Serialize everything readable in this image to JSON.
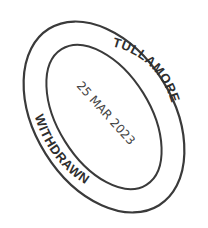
{
  "stamp": {
    "top_text": "TULLAMORE",
    "bottom_text": "WITHDRAWN",
    "date": "25 MAR 2023",
    "ink_color": "#3a3a3a",
    "background": "#ffffff"
  }
}
